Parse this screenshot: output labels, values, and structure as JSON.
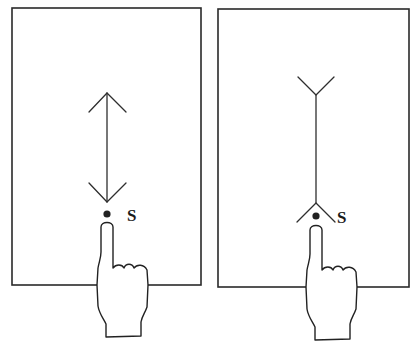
{
  "figure": {
    "panels": [
      {
        "id": "left",
        "description": "Double-headed arrow gesture above touch point",
        "touch_point_label": "S",
        "gesture_icon": "double-headed-arrow-icon"
      },
      {
        "id": "right",
        "description": "Line with forked ends above touch point",
        "touch_point_label": "S",
        "gesture_icon": "forked-line-icon"
      }
    ],
    "colors": {
      "ink": "#2a2a2a",
      "background": "#ffffff"
    }
  }
}
